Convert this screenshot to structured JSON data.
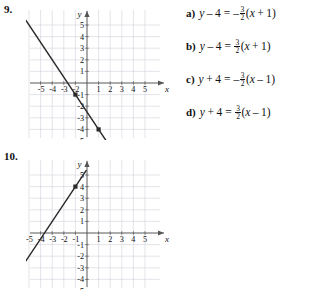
{
  "problems": [
    {
      "number": "9.",
      "graph": {
        "axis_label_x": "x",
        "axis_label_y": "y",
        "x_ticks_neg": [
          "-5",
          "-4",
          "-3",
          "-2"
        ],
        "x_ticks_pos": [
          "1",
          "2",
          "3",
          "4",
          "5"
        ],
        "y_ticks_pos": [
          "5",
          "4",
          "3",
          "2",
          "1"
        ],
        "y_ticks_neg": [
          "-1",
          "-2",
          "-3",
          "-4",
          "-5"
        ],
        "xlim": [
          -6,
          6
        ],
        "ylim": [
          -6,
          6
        ],
        "grid": true,
        "line": {
          "slope": -1.5,
          "intercept": -2.5
        },
        "points": [
          [
            -1,
            -1
          ],
          [
            1,
            -4
          ]
        ]
      }
    },
    {
      "number": "10.",
      "graph": {
        "axis_label_x": "x",
        "axis_label_y": "y",
        "x_ticks_neg": [
          "-5",
          "-4",
          "-3",
          "-2",
          "-1"
        ],
        "x_ticks_pos": [
          "1",
          "2",
          "3",
          "4",
          "5"
        ],
        "y_ticks_pos": [
          "5",
          "4",
          "3",
          "2",
          "1"
        ],
        "y_ticks_neg": [
          "-1",
          "-2",
          "-3",
          "-4",
          "-5"
        ],
        "xlim": [
          -6,
          6
        ],
        "ylim": [
          -6,
          6
        ],
        "grid": true,
        "line": {
          "slope": 1.5,
          "intercept": 5.5
        },
        "points": [
          [
            -1,
            4
          ]
        ]
      }
    }
  ],
  "answers": [
    {
      "letter": "a)",
      "lhs_var": "y",
      "lhs_op": "–",
      "lhs_num": "4",
      "equals": "=",
      "sign": "–",
      "frac_num": "3",
      "frac_den": "2",
      "paren_open": "(",
      "rhs_var": "x",
      "rhs_op": "+",
      "rhs_num": "1",
      "paren_close": ")"
    },
    {
      "letter": "b)",
      "lhs_var": "y",
      "lhs_op": "–",
      "lhs_num": "4",
      "equals": "=",
      "sign": "",
      "frac_num": "3",
      "frac_den": "2",
      "paren_open": "(",
      "rhs_var": "x",
      "rhs_op": "+",
      "rhs_num": "1",
      "paren_close": ")"
    },
    {
      "letter": "c)",
      "lhs_var": "y",
      "lhs_op": "+",
      "lhs_num": "4",
      "equals": "=",
      "sign": "–",
      "frac_num": "3",
      "frac_den": "2",
      "paren_open": "(",
      "rhs_var": "x",
      "rhs_op": "–",
      "rhs_num": "1",
      "paren_close": ")"
    },
    {
      "letter": "d)",
      "letter_label": "d)",
      "lhs_var": "y",
      "lhs_op": "+",
      "lhs_num": "4",
      "equals": "=",
      "sign": "",
      "frac_num": "3",
      "frac_den": "2",
      "paren_open": "(",
      "rhs_var": "x",
      "rhs_op": "–",
      "rhs_num": "1",
      "paren_close": ")"
    }
  ],
  "colors": {
    "grid": "#c9c9d6",
    "axis": "#555555",
    "line": "#2b2b2b",
    "text": "#111111"
  }
}
